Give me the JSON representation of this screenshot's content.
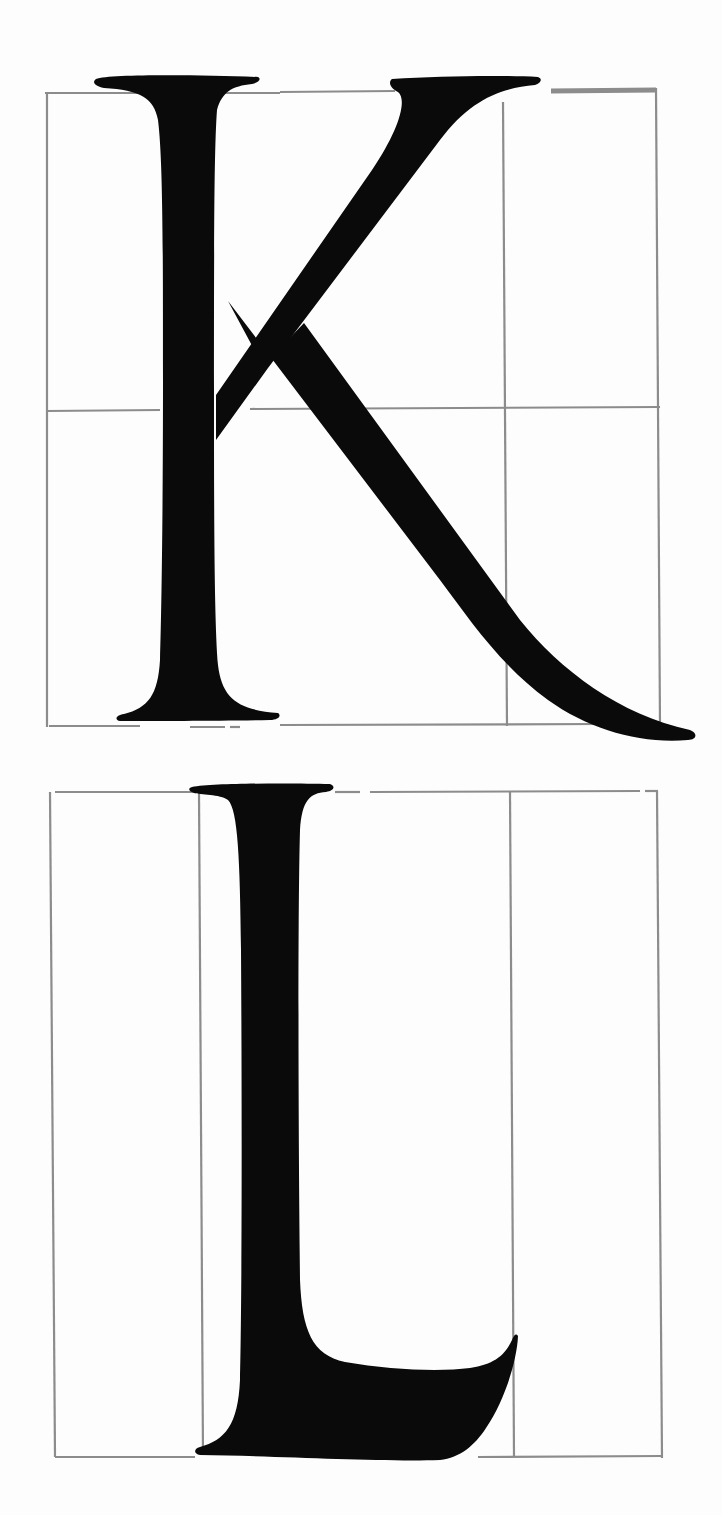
{
  "figure": {
    "colors": {
      "background": "#fdfdfd",
      "glyph": "#0a0a0a",
      "grid": "#8c8c8c"
    },
    "letters": [
      {
        "id": "K",
        "label": "K",
        "grid": {
          "left": 47,
          "right": 660,
          "top": 93,
          "bottom": 726,
          "horizontal_guides": [
            410
          ],
          "vertical_guides": [
            503
          ]
        }
      },
      {
        "id": "L",
        "label": "L",
        "grid": {
          "left": 50,
          "right": 660,
          "top": 792,
          "bottom": 1457,
          "horizontal_guides": [],
          "vertical_guides": [
            200,
            510
          ]
        }
      }
    ]
  }
}
